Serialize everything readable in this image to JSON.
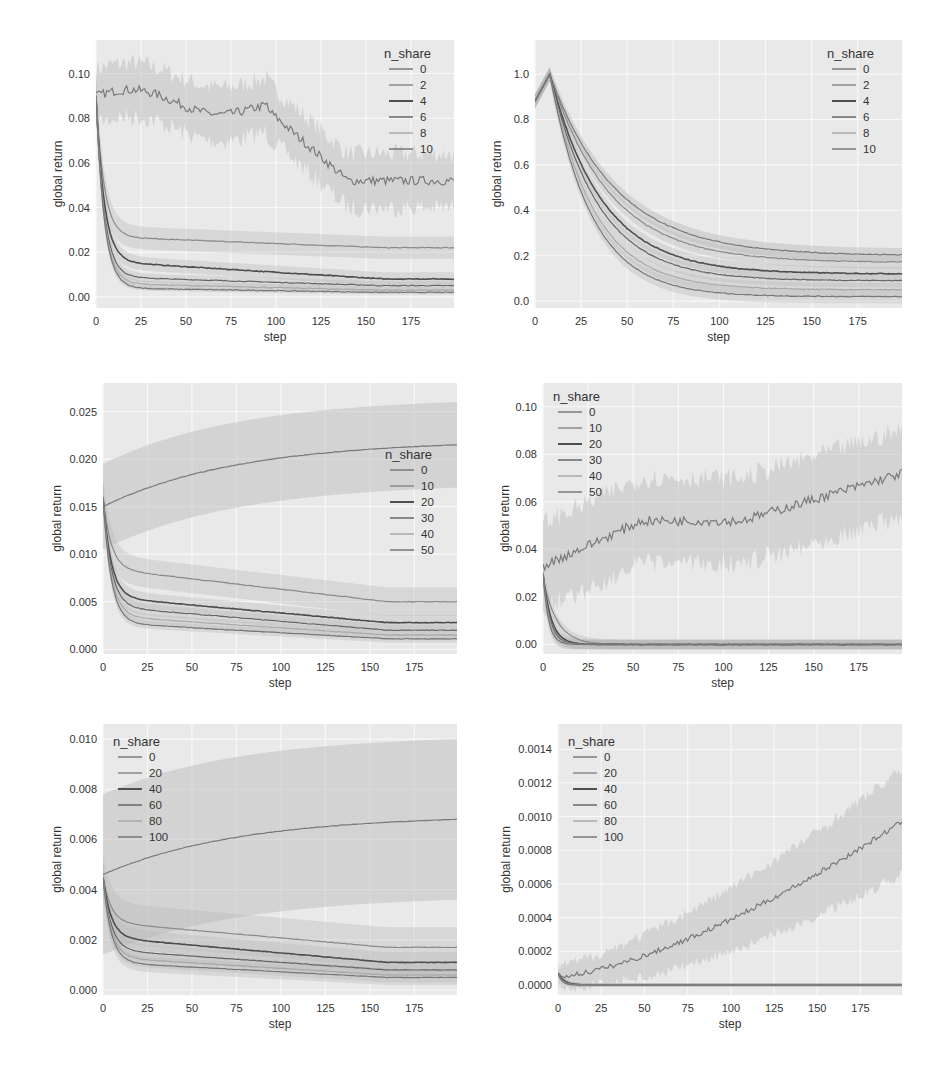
{
  "chart_data": [
    {
      "id": "top-left",
      "type": "line",
      "title": "",
      "xlabel": "step",
      "ylabel": "global return",
      "xlim": [
        0,
        199
      ],
      "ylim": [
        -0.005,
        0.115
      ],
      "xticks": [
        0,
        25,
        50,
        75,
        100,
        125,
        150,
        175
      ],
      "yticks": [
        0.0,
        0.02,
        0.04,
        0.06,
        0.08,
        0.1
      ],
      "ytick_labels": [
        "0.00",
        "0.02",
        "0.04",
        "0.06",
        "0.08",
        "0.10"
      ],
      "grid": true,
      "legend": {
        "title": "n_share",
        "position": "upper right",
        "entries": [
          "0",
          "2",
          "4",
          "6",
          "8",
          "10"
        ]
      },
      "series": [
        {
          "name": "0",
          "start": 0.09,
          "end": 0.058,
          "shape": "noisy_decline",
          "band": 0.012,
          "noise": 0.004
        },
        {
          "name": "2",
          "start": 0.09,
          "plateau": 0.027,
          "end": 0.022,
          "shape": "decay",
          "band": 0.005
        },
        {
          "name": "4",
          "start": 0.09,
          "plateau": 0.016,
          "end": 0.008,
          "shape": "decay",
          "band": 0.003
        },
        {
          "name": "6",
          "start": 0.09,
          "plateau": 0.009,
          "end": 0.005,
          "shape": "decay",
          "band": 0.002
        },
        {
          "name": "8",
          "start": 0.09,
          "plateau": 0.006,
          "end": 0.003,
          "shape": "decay",
          "band": 0.0015
        },
        {
          "name": "10",
          "start": 0.09,
          "plateau": 0.004,
          "end": 0.002,
          "shape": "decay",
          "band": 0.001
        }
      ]
    },
    {
      "id": "top-right",
      "type": "line",
      "title": "",
      "xlabel": "step",
      "ylabel": "global return",
      "xlim": [
        0,
        199
      ],
      "ylim": [
        -0.03,
        1.15
      ],
      "xticks": [
        0,
        25,
        50,
        75,
        100,
        125,
        150,
        175
      ],
      "yticks": [
        0.0,
        0.2,
        0.4,
        0.6,
        0.8,
        1.0
      ],
      "ytick_labels": [
        "0.0",
        "0.2",
        "0.4",
        "0.6",
        "0.8",
        "1.0"
      ],
      "grid": true,
      "legend": {
        "title": "n_share",
        "position": "upper right",
        "entries": [
          "0",
          "2",
          "4",
          "6",
          "8",
          "10"
        ]
      },
      "series": [
        {
          "name": "0",
          "start": 0.88,
          "peak": 1.0,
          "end": 0.2,
          "shape": "peak_decay",
          "band": 0.03
        },
        {
          "name": "2",
          "start": 0.88,
          "peak": 1.0,
          "end": 0.17,
          "shape": "peak_decay",
          "band": 0.03
        },
        {
          "name": "4",
          "start": 0.88,
          "peak": 1.0,
          "end": 0.12,
          "shape": "peak_decay",
          "band": 0.03
        },
        {
          "name": "6",
          "start": 0.88,
          "peak": 1.0,
          "end": 0.09,
          "shape": "peak_decay",
          "band": 0.03
        },
        {
          "name": "8",
          "start": 0.88,
          "peak": 1.0,
          "end": 0.05,
          "shape": "peak_decay",
          "band": 0.03
        },
        {
          "name": "10",
          "start": 0.88,
          "peak": 1.0,
          "end": 0.02,
          "shape": "peak_decay",
          "band": 0.03
        }
      ]
    },
    {
      "id": "middle-left",
      "type": "line",
      "title": "",
      "xlabel": "step",
      "ylabel": "global return",
      "xlim": [
        0,
        199
      ],
      "ylim": [
        -0.0005,
        0.028
      ],
      "xticks": [
        0,
        25,
        50,
        75,
        100,
        125,
        150,
        175
      ],
      "yticks": [
        0.0,
        0.005,
        0.01,
        0.015,
        0.02,
        0.025
      ],
      "ytick_labels": [
        "0.000",
        "0.005",
        "0.010",
        "0.015",
        "0.020",
        "0.025"
      ],
      "grid": true,
      "legend": {
        "title": "n_share",
        "position": "center right",
        "entries": [
          "0",
          "10",
          "20",
          "30",
          "40",
          "50"
        ]
      },
      "series": [
        {
          "name": "0",
          "start": 0.015,
          "end": 0.0215,
          "shape": "rise",
          "band": 0.0045
        },
        {
          "name": "10",
          "start": 0.016,
          "plateau": 0.0085,
          "end": 0.005,
          "shape": "decay",
          "band": 0.0015
        },
        {
          "name": "20",
          "start": 0.016,
          "plateau": 0.0055,
          "end": 0.0028,
          "shape": "decay",
          "band": 0.0008
        },
        {
          "name": "30",
          "start": 0.016,
          "plateau": 0.0045,
          "end": 0.002,
          "shape": "decay",
          "band": 0.0006
        },
        {
          "name": "40",
          "start": 0.016,
          "plateau": 0.0035,
          "end": 0.0015,
          "shape": "decay",
          "band": 0.0005
        },
        {
          "name": "50",
          "start": 0.016,
          "plateau": 0.0028,
          "end": 0.0011,
          "shape": "decay",
          "band": 0.0004
        }
      ]
    },
    {
      "id": "middle-right",
      "type": "line",
      "title": "",
      "xlabel": "step",
      "ylabel": "global return",
      "xlim": [
        0,
        199
      ],
      "ylim": [
        -0.004,
        0.11
      ],
      "xticks": [
        0,
        25,
        50,
        75,
        100,
        125,
        150,
        175
      ],
      "yticks": [
        0.0,
        0.02,
        0.04,
        0.06,
        0.08,
        0.1
      ],
      "ytick_labels": [
        "0.00",
        "0.02",
        "0.04",
        "0.06",
        "0.08",
        "0.10"
      ],
      "grid": true,
      "legend": {
        "title": "n_share",
        "position": "upper left",
        "entries": [
          "0",
          "10",
          "20",
          "30",
          "40",
          "50"
        ]
      },
      "series": [
        {
          "name": "0",
          "start": 0.033,
          "mid": 0.052,
          "end": 0.072,
          "shape": "noisy_rise",
          "band": 0.018,
          "noise": 0.004
        },
        {
          "name": "10",
          "start": 0.028,
          "end": 0.0,
          "shape": "fast_decay",
          "k": 0.13,
          "band": 0.002
        },
        {
          "name": "20",
          "start": 0.03,
          "end": 0.0,
          "shape": "fast_decay",
          "k": 0.22,
          "band": 0.002
        },
        {
          "name": "30",
          "start": 0.03,
          "end": 0.0,
          "shape": "fast_decay",
          "k": 0.26,
          "band": 0.002
        },
        {
          "name": "40",
          "start": 0.03,
          "end": 0.0,
          "shape": "fast_decay",
          "k": 0.3,
          "band": 0.002
        },
        {
          "name": "50",
          "start": 0.03,
          "end": 0.0,
          "shape": "fast_decay",
          "k": 0.34,
          "band": 0.002
        }
      ]
    },
    {
      "id": "bottom-left",
      "type": "line",
      "title": "",
      "xlabel": "step",
      "ylabel": "global return",
      "xlim": [
        0,
        199
      ],
      "ylim": [
        -0.0002,
        0.0106
      ],
      "xticks": [
        0,
        25,
        50,
        75,
        100,
        125,
        150,
        175
      ],
      "yticks": [
        0.0,
        0.002,
        0.004,
        0.006,
        0.008,
        0.01
      ],
      "ytick_labels": [
        "0.000",
        "0.002",
        "0.004",
        "0.006",
        "0.008",
        "0.010"
      ],
      "grid": true,
      "legend": {
        "title": "n_share",
        "position": "upper left",
        "entries": [
          "0",
          "20",
          "40",
          "60",
          "80",
          "100"
        ]
      },
      "series": [
        {
          "name": "0",
          "start": 0.0046,
          "end": 0.0068,
          "shape": "rise",
          "band": 0.0032
        },
        {
          "name": "20",
          "start": 0.0045,
          "plateau": 0.0027,
          "end": 0.0017,
          "shape": "decay",
          "band": 0.0008
        },
        {
          "name": "40",
          "start": 0.0045,
          "plateau": 0.0021,
          "end": 0.0011,
          "shape": "decay",
          "band": 0.0004
        },
        {
          "name": "60",
          "start": 0.0045,
          "plateau": 0.0016,
          "end": 0.0008,
          "shape": "decay",
          "band": 0.0003
        },
        {
          "name": "80",
          "start": 0.0045,
          "plateau": 0.0013,
          "end": 0.0006,
          "shape": "decay",
          "band": 0.0003
        },
        {
          "name": "100",
          "start": 0.0045,
          "plateau": 0.0011,
          "end": 0.0005,
          "shape": "decay",
          "band": 0.0003
        }
      ]
    },
    {
      "id": "bottom-right",
      "type": "line",
      "title": "",
      "xlabel": "step",
      "ylabel": "global return",
      "xlim": [
        0,
        199
      ],
      "ylim": [
        -6e-05,
        0.00155
      ],
      "xticks": [
        0,
        25,
        50,
        75,
        100,
        125,
        150,
        175
      ],
      "yticks": [
        0.0,
        0.0002,
        0.0004,
        0.0006,
        0.0008,
        0.001,
        0.0012,
        0.0014
      ],
      "ytick_labels": [
        "0.0000",
        "0.0002",
        "0.0004",
        "0.0006",
        "0.0008",
        "0.0010",
        "0.0012",
        "0.0014"
      ],
      "grid": true,
      "legend": {
        "title": "n_share",
        "position": "upper left",
        "entries": [
          "0",
          "20",
          "40",
          "60",
          "80",
          "100"
        ]
      },
      "series": [
        {
          "name": "0",
          "start": 5e-05,
          "end": 0.00097,
          "shape": "accel_rise",
          "band": 0.00025,
          "noise": 3e-05
        },
        {
          "name": "20",
          "start": 7e-05,
          "end": 0.0,
          "shape": "fast_decay",
          "k": 0.25,
          "band": 1e-05
        },
        {
          "name": "40",
          "start": 7e-05,
          "end": 0.0,
          "shape": "fast_decay",
          "k": 0.3,
          "band": 1e-05
        },
        {
          "name": "60",
          "start": 7e-05,
          "end": 0.0,
          "shape": "fast_decay",
          "k": 0.35,
          "band": 1e-05
        },
        {
          "name": "80",
          "start": 7e-05,
          "end": 0.0,
          "shape": "fast_decay",
          "k": 0.4,
          "band": 1e-05
        },
        {
          "name": "100",
          "start": 7e-05,
          "end": 0.0,
          "shape": "fast_decay",
          "k": 0.45,
          "band": 1e-05
        }
      ]
    }
  ],
  "style": {
    "plot_bg": "#e9e9e9",
    "grid_color": "#f8f8f8",
    "line_colors": [
      "#7a7a7a",
      "#8a8a8a",
      "#4e4e4e",
      "#666666",
      "#a8a8a8",
      "#777777"
    ],
    "band_color": "#b8b8b8"
  }
}
